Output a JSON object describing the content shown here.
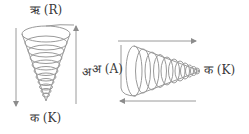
{
  "figure_left": {
    "label_top": "ऋ (R)",
    "label_bottom": "क (K)",
    "label_side": "अ",
    "description": "vertical spiral cone, tip pointing down"
  },
  "figure_right": {
    "label_left": "अ (A)",
    "label_right": "क (K)",
    "description": "horizontal spiral cone, tip pointing right"
  },
  "colors": {
    "line": "#8c8c8c",
    "text": "#3a3a3a"
  }
}
